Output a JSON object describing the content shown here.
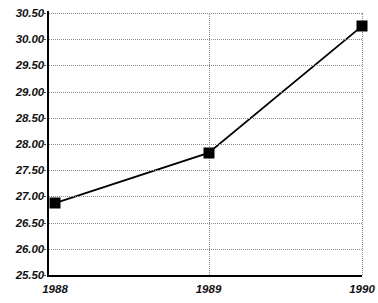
{
  "chart_data": {
    "type": "line",
    "title": "",
    "subtitle": "",
    "xlabel": "",
    "ylabel": "",
    "categories": [
      "1988",
      "1989",
      "1990"
    ],
    "x": [
      1988,
      1989,
      1990
    ],
    "values": [
      26.87,
      27.83,
      30.25
    ],
    "series": [
      {
        "name": "",
        "values": [
          26.87,
          27.83,
          30.25
        ]
      }
    ],
    "ylim": [
      25.5,
      30.5
    ],
    "ytick_labels": [
      "30.50",
      "30.00",
      "29.50",
      "29.00",
      "28.50",
      "28.00",
      "27.50",
      "27.00",
      "26.50",
      "26.00",
      "25.50"
    ],
    "ytick_values": [
      30.5,
      30.0,
      29.5,
      29.0,
      28.5,
      28.0,
      27.5,
      27.0,
      26.5,
      26.0,
      25.5
    ],
    "xtick_labels": [
      "1988",
      "1989",
      "1990"
    ],
    "grid": true,
    "grid_style": "dotted",
    "legend": false,
    "legend_position": "none",
    "marker": "filled-square",
    "line_color": "#000000",
    "marker_color": "#000000",
    "grid_color": "#8a8a8a",
    "axis_color": "#000000",
    "background_color": "#ffffff"
  }
}
